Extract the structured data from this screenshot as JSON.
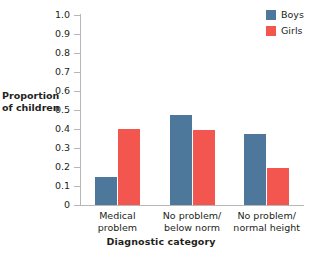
{
  "chart_data": {
    "type": "bar",
    "title": "",
    "xlabel": "Diagnostic category",
    "ylabel": "Proportion of children",
    "ylabel_lines": [
      "Proportion",
      "of children"
    ],
    "categories": [
      "Medical problem",
      "No problem/ below norm",
      "No problem/ normal height"
    ],
    "category_lines": [
      [
        "Medical",
        "problem"
      ],
      [
        "No problem/",
        "below norm"
      ],
      [
        "No problem/",
        "normal height"
      ]
    ],
    "series": [
      {
        "name": "Boys",
        "color": "#4e789b",
        "values": [
          0.145,
          0.475,
          0.375
        ]
      },
      {
        "name": "Girls",
        "color": "#f2564e",
        "values": [
          0.4,
          0.395,
          0.195
        ]
      }
    ],
    "ylim": [
      0,
      1.0
    ],
    "ytick_values": [
      1.0,
      0.9,
      0.8,
      0.7,
      0.6,
      0.5,
      0.4,
      0.3,
      0.2,
      0.1,
      0
    ],
    "ytick_labels": [
      "1.0",
      "0.9",
      "0.8",
      "0.7",
      "0.6",
      "0.5",
      "0.4",
      "0.3",
      "0.2",
      "0.1",
      "0"
    ],
    "grid": false,
    "legend_position": "top-right",
    "legend_entries": [
      "Boys",
      "Girls"
    ]
  },
  "legend": {
    "boys_label": "Boys",
    "girls_label": "Girls"
  },
  "axes": {
    "y_title_line1": "Proportion",
    "y_title_line2": "of children",
    "x_title": "Diagnostic category"
  }
}
